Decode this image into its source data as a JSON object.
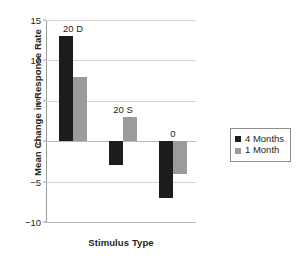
{
  "chart_data": {
    "type": "bar",
    "title": "",
    "xlabel": "Stimulus Type",
    "ylabel": "Mean Change in Response Rate",
    "categories": [
      "20 D",
      "20 S",
      "0"
    ],
    "series": [
      {
        "name": "4 Months",
        "color": "#1c1c1c",
        "values": [
          13,
          -3,
          -7
        ]
      },
      {
        "name": "1 Month",
        "color": "#9b9b9b",
        "values": [
          8,
          3,
          -4
        ]
      }
    ],
    "ylim": [
      -10,
      15
    ],
    "yticks": [
      15,
      10,
      5,
      0,
      -5,
      -10
    ],
    "ytick_labels": [
      "15",
      "10",
      "5",
      "0",
      "−5",
      "−10"
    ],
    "grid": true,
    "legend_position": "right",
    "legend_entries": [
      "4 Months",
      "1 Month"
    ],
    "category_label_position": "above-group"
  },
  "axes": {
    "y_title": "Mean Change in Response Rate",
    "x_title": "Stimulus Type"
  },
  "legend": {
    "items": [
      {
        "label": "4 Months",
        "color": "#1c1c1c"
      },
      {
        "label": "1 Month",
        "color": "#9b9b9b"
      }
    ]
  }
}
